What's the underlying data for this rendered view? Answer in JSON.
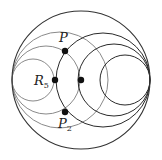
{
  "diagram": {
    "type": "coaxial-circles",
    "colors": {
      "background": "#ffffff",
      "outer_circle": "#333333",
      "left_family": "#8a8a8a",
      "right_family": "#2a2a2a",
      "points": "#111111"
    },
    "outer_circle": {
      "cx": 81,
      "cy": 80,
      "r": 69
    },
    "left_family": [
      {
        "cx": 33,
        "cy": 80,
        "r": 21
      },
      {
        "cx": 46,
        "cy": 80,
        "r": 34
      },
      {
        "cx": 60,
        "cy": 80,
        "r": 48
      }
    ],
    "right_family": [
      {
        "cx": 125,
        "cy": 80,
        "r": 25
      },
      {
        "cx": 114,
        "cy": 80,
        "r": 36
      },
      {
        "cx": 103,
        "cy": 80,
        "r": 47
      }
    ],
    "points": [
      {
        "id": "P",
        "x": 65,
        "y": 51
      },
      {
        "id": "R5",
        "x": 55,
        "y": 80
      },
      {
        "id": "M",
        "x": 81,
        "y": 80
      },
      {
        "id": "P2",
        "x": 65,
        "y": 112
      }
    ],
    "labels": {
      "P": {
        "main": "P",
        "sub": ""
      },
      "R5": {
        "main": "R",
        "sub": "5"
      },
      "P2": {
        "main": "P",
        "sub": "2"
      }
    }
  }
}
